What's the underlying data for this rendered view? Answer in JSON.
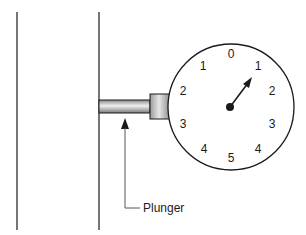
{
  "diagram": {
    "type": "dial-indicator-with-plunger",
    "walls": [
      {
        "name": "left-wall-line",
        "x": 17,
        "y1": 12,
        "y2": 230
      },
      {
        "name": "right-wall-line",
        "x": 99,
        "y1": 12,
        "y2": 230
      }
    ],
    "plunger": {
      "label": "Plunger",
      "shaft": {
        "x": 99,
        "y": 100,
        "width": 51,
        "height": 13
      },
      "collar": {
        "x": 150,
        "y": 94,
        "width": 20,
        "height": 25
      }
    },
    "gauge": {
      "center": {
        "x": 231,
        "y": 107
      },
      "radius": 63,
      "scale_labels": [
        {
          "text": "0",
          "x": 231,
          "y": 54
        },
        {
          "text": "1",
          "x": 258,
          "y": 66
        },
        {
          "text": "2",
          "x": 272,
          "y": 91
        },
        {
          "text": "3",
          "x": 272,
          "y": 124
        },
        {
          "text": "4",
          "x": 258,
          "y": 149
        },
        {
          "text": "5",
          "x": 231,
          "y": 158
        },
        {
          "text": "4",
          "x": 204,
          "y": 149
        },
        {
          "text": "3",
          "x": 183,
          "y": 124
        },
        {
          "text": "2",
          "x": 183,
          "y": 91
        },
        {
          "text": "1",
          "x": 203,
          "y": 66
        }
      ],
      "needle": {
        "hub": {
          "x": 230,
          "y": 107
        },
        "tip": {
          "x": 252,
          "y": 78
        },
        "reading": "1"
      }
    },
    "callout": {
      "arrow_tip": {
        "x": 125,
        "y": 118
      },
      "path": [
        [
          125,
          130
        ],
        [
          125,
          208
        ],
        [
          140,
          208
        ]
      ],
      "text_pos": {
        "x": 143,
        "y": 212
      }
    },
    "colors": {
      "line": "#1a1a1a",
      "callout_line": "#555555",
      "shaft_light": "#e8e8e8",
      "shaft_dark": "#8a8a8a"
    }
  }
}
